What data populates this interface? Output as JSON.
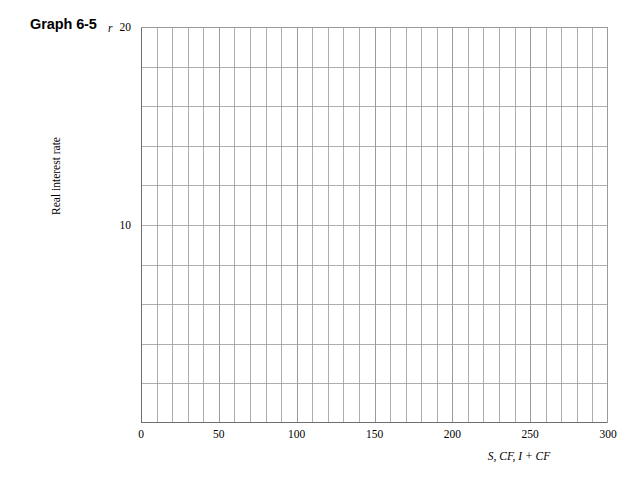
{
  "figure": {
    "title": "Graph 6-5"
  },
  "chart_data": {
    "type": "line",
    "title": "Graph 6-5",
    "subtitle": "",
    "xlabel": "S, CF, I + CF",
    "ylabel": "Real interest rate",
    "y_axis_symbol": "r",
    "xlim": [
      0,
      300
    ],
    "ylim": [
      0,
      20
    ],
    "x_tick_labels": [
      "0",
      "50",
      "100",
      "150",
      "200",
      "250",
      "300"
    ],
    "x_tick_values": [
      0,
      50,
      100,
      150,
      200,
      250,
      300
    ],
    "y_tick_labels": [
      "10",
      "20"
    ],
    "y_tick_values": [
      10,
      20
    ],
    "x_gridline_step": 10,
    "y_gridline_step": 2,
    "x_gridline_count": 31,
    "y_gridline_count": 11,
    "grid": true,
    "legend": null,
    "legend_position": "none",
    "series": [],
    "annotations": [],
    "note": "Empty grid worksheet; no data series plotted."
  },
  "style": {
    "background_color": "#ffffff",
    "gridline_color": "#9a9a9a",
    "border_color": "#6e6e6e",
    "text_color": "#000000"
  }
}
